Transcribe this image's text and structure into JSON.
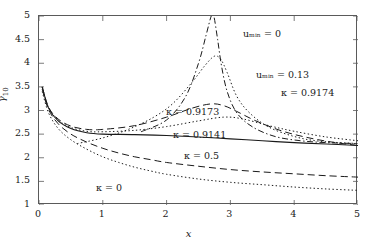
{
  "chart_data": {
    "type": "line",
    "title": "",
    "xlabel": "x",
    "ylabel": "gamma_10",
    "xlim": [
      0,
      5
    ],
    "ylim": [
      1,
      5
    ],
    "xticks": [
      0,
      1,
      2,
      3,
      4,
      5
    ],
    "yticks": [
      1,
      1.5,
      2,
      2.5,
      3,
      3.5,
      4,
      4.5,
      5
    ],
    "xtick_labels": [
      "0",
      "1",
      "2",
      "3",
      "4",
      "5"
    ],
    "ytick_labels": [
      "1",
      "1.5",
      "2",
      "2.5",
      "3",
      "3.5",
      "4",
      "4.5",
      "5"
    ],
    "grid": false,
    "legend_position": "in-plot annotations",
    "series": [
      {
        "name": "kappa = 0",
        "label": "κ = 0",
        "style": "dotted",
        "x": [
          0.05,
          0.15,
          0.3,
          0.5,
          0.75,
          1.0,
          1.25,
          1.5,
          1.75,
          2.0,
          2.5,
          3.0,
          3.5,
          4.0,
          4.5,
          5.0
        ],
        "y": [
          3.4,
          2.95,
          2.62,
          2.38,
          2.18,
          2.02,
          1.9,
          1.8,
          1.72,
          1.65,
          1.55,
          1.48,
          1.43,
          1.38,
          1.34,
          1.31
        ]
      },
      {
        "name": "kappa = 0.5",
        "label": "κ = 0.5",
        "style": "dashed",
        "x": [
          0.05,
          0.15,
          0.3,
          0.5,
          0.75,
          1.0,
          1.25,
          1.5,
          1.75,
          2.0,
          2.5,
          3.0,
          3.5,
          4.0,
          4.5,
          5.0
        ],
        "y": [
          3.45,
          3.02,
          2.72,
          2.5,
          2.33,
          2.2,
          2.1,
          2.02,
          1.96,
          1.9,
          1.82,
          1.75,
          1.7,
          1.66,
          1.62,
          1.59
        ]
      },
      {
        "name": "kappa = 0.9141",
        "label": "κ = 0.9141",
        "style": "solid",
        "x": [
          0.05,
          0.15,
          0.3,
          0.5,
          0.75,
          1.0,
          1.5,
          2.0,
          2.5,
          3.0,
          3.5,
          4.0,
          4.5,
          5.0
        ],
        "y": [
          3.5,
          3.05,
          2.78,
          2.62,
          2.53,
          2.5,
          2.49,
          2.47,
          2.44,
          2.4,
          2.36,
          2.32,
          2.29,
          2.26
        ]
      },
      {
        "name": "kappa = 0.9173",
        "label": "κ = 0.9173",
        "style": "dotted",
        "x": [
          0.05,
          0.15,
          0.3,
          0.5,
          0.75,
          1.0,
          1.5,
          2.0,
          2.5,
          2.9,
          3.2,
          3.6,
          4.0,
          4.5,
          5.0
        ],
        "y": [
          3.5,
          3.06,
          2.8,
          2.64,
          2.56,
          2.55,
          2.58,
          2.66,
          2.78,
          2.86,
          2.82,
          2.68,
          2.56,
          2.44,
          2.36
        ]
      },
      {
        "name": "kappa = 0.9174",
        "label": "κ = 0.9174",
        "style": "dashed",
        "x": [
          0.05,
          0.15,
          0.3,
          0.5,
          0.75,
          1.0,
          1.5,
          2.0,
          2.4,
          2.7,
          2.9,
          3.1,
          3.4,
          3.8,
          4.2,
          4.6,
          5.0
        ],
        "y": [
          3.5,
          3.07,
          2.82,
          2.67,
          2.6,
          2.6,
          2.68,
          2.86,
          3.05,
          3.14,
          3.1,
          2.98,
          2.78,
          2.57,
          2.43,
          2.33,
          2.26
        ]
      },
      {
        "name": "u_min = 0.13",
        "label": "uₘᵢₙ = 0.13",
        "style": "dotted-peak",
        "x": [
          0.6,
          1.0,
          1.4,
          1.8,
          2.1,
          2.4,
          2.6,
          2.75,
          2.85,
          2.95,
          3.1,
          3.3,
          3.6,
          4.0,
          4.4,
          5.0
        ],
        "y": [
          2.3,
          2.42,
          2.6,
          2.86,
          3.15,
          3.6,
          3.95,
          4.15,
          4.08,
          3.8,
          3.3,
          2.95,
          2.65,
          2.45,
          2.35,
          2.3
        ]
      },
      {
        "name": "u_min = 0",
        "label": "uₘᵢₙ = 0",
        "style": "dash-dot-spike",
        "x": [
          1.6,
          2.0,
          2.3,
          2.5,
          2.62,
          2.7,
          2.74,
          2.8,
          2.86,
          2.95,
          3.1,
          3.35,
          3.7,
          4.1,
          4.5,
          5.0
        ],
        "y": [
          2.55,
          2.8,
          3.3,
          4.0,
          4.6,
          5.0,
          5.0,
          4.5,
          3.95,
          3.4,
          2.95,
          2.65,
          2.45,
          2.36,
          2.32,
          2.3
        ]
      }
    ],
    "annotations": [
      {
        "id": "anno-umin-0",
        "text": "uₘᵢₙ = 0",
        "x_px": 243,
        "y_px": 29
      },
      {
        "id": "anno-umin-013",
        "text": "uₘᵢₙ = 0.13",
        "x_px": 256,
        "y_px": 70
      },
      {
        "id": "anno-kappa-9174",
        "text": "κ = 0.9174",
        "x_px": 281,
        "y_px": 88
      },
      {
        "id": "anno-kappa-9173",
        "text": "κ = 0.9173",
        "x_px": 166,
        "y_px": 107
      },
      {
        "id": "anno-kappa-9141",
        "text": "κ = 0.9141",
        "x_px": 173,
        "y_px": 130
      },
      {
        "id": "anno-kappa-05",
        "text": "κ = 0.5",
        "x_px": 184,
        "y_px": 151
      },
      {
        "id": "anno-kappa-0",
        "text": "κ = 0",
        "x_px": 96,
        "y_px": 183
      }
    ],
    "colors": {
      "axis": "#5a5a5a",
      "curve": "#1a1a1a",
      "background": "#ffffff"
    }
  }
}
